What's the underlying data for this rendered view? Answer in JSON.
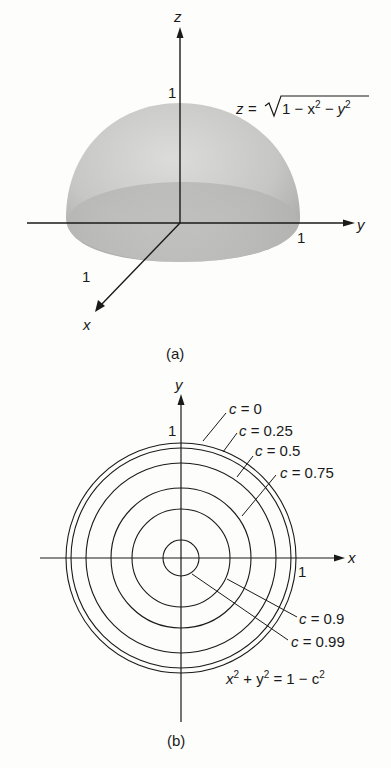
{
  "panel_a": {
    "caption": "(a)",
    "axes": {
      "z": "z",
      "y": "y",
      "x": "x"
    },
    "ticks": {
      "z": "1",
      "y": "1",
      "x": "1"
    },
    "equation": {
      "lhs": "z = ",
      "radicand_1": "1 − x",
      "exp1": "2",
      "radicand_2": " − y",
      "exp2": "2"
    },
    "surface": "upper unit hemisphere"
  },
  "panel_b": {
    "caption": "(b)",
    "axes": {
      "x": "x",
      "y": "y"
    },
    "ticks": {
      "x": "1",
      "y": "1"
    },
    "level_curves": [
      {
        "label": "c = 0",
        "c": 0,
        "radius": 1.0
      },
      {
        "label": "c = 0.25",
        "c": 0.25,
        "radius": 0.968
      },
      {
        "label": "c = 0.5",
        "c": 0.5,
        "radius": 0.866
      },
      {
        "label": "c = 0.75",
        "c": 0.75,
        "radius": 0.661
      },
      {
        "label": "c = 0.9",
        "c": 0.9,
        "radius": 0.436
      },
      {
        "label": "c = 0.99",
        "c": 0.99,
        "radius": 0.141
      }
    ],
    "equation": {
      "a": "x",
      "e1": "2",
      "b": " + y",
      "e2": "2",
      "c": " = 1 − c",
      "e3": "2"
    }
  },
  "colors": {
    "ink": "#1a1a1a",
    "shade_light": "#d8d8d6",
    "shade_dark": "#a9a9a7",
    "paper": "#fdfdfb"
  }
}
